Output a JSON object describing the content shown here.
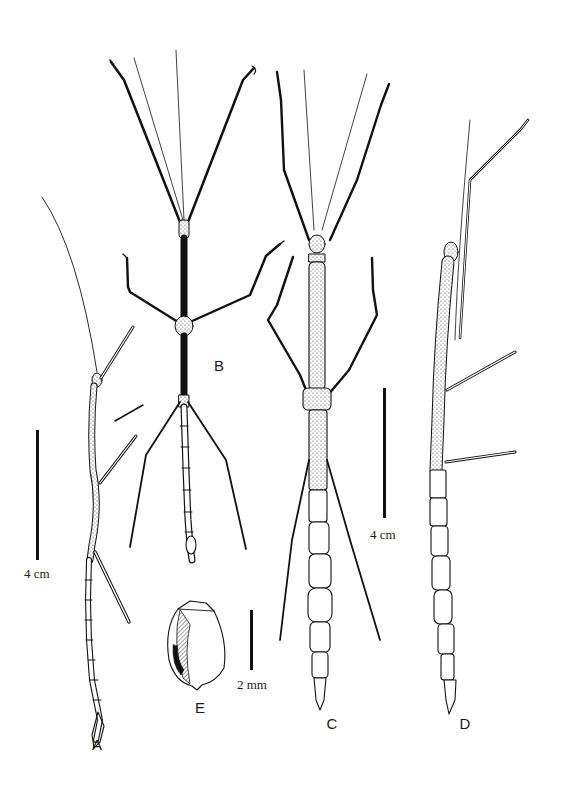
{
  "figure": {
    "panels": [
      {
        "id": "A",
        "label": "A"
      },
      {
        "id": "B",
        "label": "B"
      },
      {
        "id": "C",
        "label": "C"
      },
      {
        "id": "D",
        "label": "D"
      },
      {
        "id": "E",
        "label": "E"
      }
    ],
    "scale_bars": [
      {
        "id": "left",
        "label": "4 cm"
      },
      {
        "id": "right",
        "label": "4 cm"
      },
      {
        "id": "egg",
        "label": "2 mm"
      }
    ],
    "colors": {
      "ink": "#111111",
      "background": "#ffffff"
    }
  }
}
